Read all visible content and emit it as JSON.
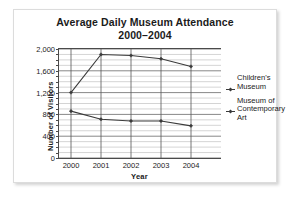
{
  "chart_data": {
    "type": "line",
    "title": "Average Daily Museum Attendance",
    "subtitle": "2000–2004",
    "xlabel": "Year",
    "ylabel": "Number of Visitors",
    "categories": [
      "2000",
      "2001",
      "2002",
      "2003",
      "2004"
    ],
    "x": [
      2000,
      2001,
      2002,
      2003,
      2004
    ],
    "ylim": [
      0,
      2000
    ],
    "xlim": [
      1999.6,
      2005.0
    ],
    "ytick_labels": [
      "0",
      "400",
      "800",
      "1,200",
      "1,600",
      "2,000"
    ],
    "ytick_values": [
      0,
      400,
      800,
      1200,
      1600,
      2000
    ],
    "minor_tick_step": 100,
    "grid": "horizontal-and-vertical",
    "legend_position": "right",
    "series": [
      {
        "name": "Children's Museum",
        "name_lines": "Children's\nMuseum",
        "color": "#3a3a3a",
        "marker": "diamond",
        "values": [
          1200,
          1900,
          1880,
          1820,
          1680
        ]
      },
      {
        "name": "Museum of Contemporary Art",
        "name_lines": "Museum of\nContemporary\nArt",
        "color": "#3a3a3a",
        "marker": "diamond",
        "values": [
          860,
          710,
          680,
          680,
          590
        ]
      }
    ]
  },
  "figure": {
    "frame_border_color": "#dcdcdc",
    "axis_color": "#4a4a4a",
    "minor_grid_color": "#a8a8a8",
    "major_grid_color": "#555555",
    "text_color": "#1b1b1b",
    "background": "#ffffff"
  }
}
